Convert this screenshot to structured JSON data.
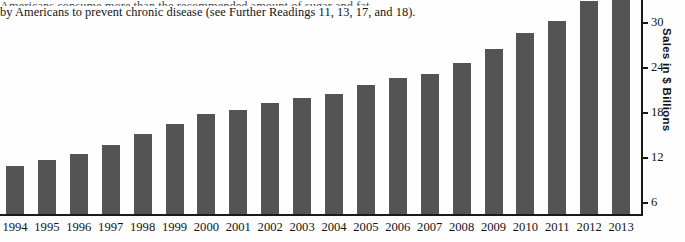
{
  "page_text": {
    "clipped_line": "Americans consume more than the recommended amount of sugar and fat",
    "line": "by Americans to prevent chronic disease (see Further Readings 11, 13, 17, and 18)."
  },
  "chart_data": {
    "type": "bar",
    "title": "",
    "xlabel": "",
    "ylabel": "Sales in $ Billions",
    "categories": [
      "1994",
      "1995",
      "1996",
      "1997",
      "1998",
      "1999",
      "2000",
      "2001",
      "2002",
      "2003",
      "2004",
      "2005",
      "2006",
      "2007",
      "2008",
      "2009",
      "2010",
      "2011",
      "2012",
      "2013"
    ],
    "values": [
      11.0,
      11.7,
      12.5,
      13.8,
      15.2,
      16.6,
      17.9,
      18.4,
      19.3,
      20.0,
      20.6,
      21.8,
      22.7,
      23.2,
      24.7,
      26.6,
      28.7,
      30.3,
      33.0,
      34.6
    ],
    "ytick_values": [
      6,
      12,
      18,
      24,
      30
    ],
    "ytick_labels": [
      "6",
      "12",
      "18",
      "24",
      "30"
    ],
    "ylim": [
      0,
      35
    ],
    "grid": false,
    "legend": "none",
    "axis_position": "right",
    "bar_color": "#545454",
    "axis_color": "#1a1a1a"
  }
}
